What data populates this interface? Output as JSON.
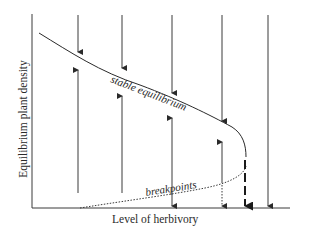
{
  "diagram": {
    "y_axis_label": "Equilibrium plant density",
    "x_axis_label": "Level of herbivory",
    "curve_labels": {
      "stable": "stable equilibrium",
      "breakpoints": "breakpoints"
    },
    "colors": {
      "line": "#3a3a3a",
      "background": "#ffffff"
    },
    "arrows": [
      {
        "x": 78,
        "direction": "down-to-curve-and-up-from-axis"
      },
      {
        "x": 122,
        "direction": "down-to-curve-and-up-from-axis"
      },
      {
        "x": 172,
        "direction": "down-to-curve-and-up-from-breakpoint"
      },
      {
        "x": 222,
        "direction": "down-to-curve-up-from-breakpoint-dotted-down"
      },
      {
        "x": 245,
        "direction": "dashed-down-to-axis"
      },
      {
        "x": 268,
        "direction": "down-to-axis"
      }
    ]
  }
}
